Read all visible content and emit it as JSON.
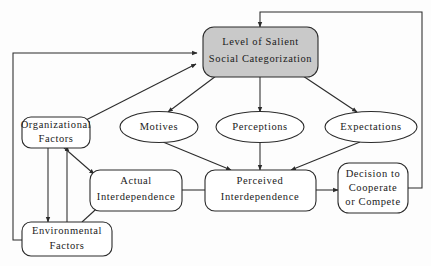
{
  "diagram": {
    "background_color": "#fdfdfd",
    "line_color": "#2b2b2b",
    "highlight_fill": "#c9c9c9",
    "node_fill": "#ffffff",
    "nodes": [
      {
        "id": "salient",
        "shape": "rounded-rect",
        "fill": "#c9c9c9",
        "lines": [
          "Level of Salient",
          "Social  Categorization"
        ]
      },
      {
        "id": "organizational",
        "shape": "rounded-rect",
        "fill": "#ffffff",
        "lines": [
          "Organizational",
          "Factors"
        ]
      },
      {
        "id": "environmental",
        "shape": "rounded-rect",
        "fill": "#ffffff",
        "lines": [
          "Environmental",
          "Factors"
        ]
      },
      {
        "id": "motives",
        "shape": "ellipse",
        "fill": "#ffffff",
        "lines": [
          "Motives"
        ]
      },
      {
        "id": "perceptions",
        "shape": "ellipse",
        "fill": "#ffffff",
        "lines": [
          "Perceptions"
        ]
      },
      {
        "id": "expectations",
        "shape": "ellipse",
        "fill": "#ffffff",
        "lines": [
          "Expectations"
        ]
      },
      {
        "id": "actual",
        "shape": "rounded-rect",
        "fill": "#ffffff",
        "lines": [
          "Actual",
          "Interdependence"
        ]
      },
      {
        "id": "perceived",
        "shape": "rounded-rect",
        "fill": "#ffffff",
        "lines": [
          "Perceived",
          "Interdependence"
        ]
      },
      {
        "id": "decision",
        "shape": "rounded-rect",
        "fill": "#ffffff",
        "lines": [
          "Decision  to",
          "Cooperate",
          "or  Compete"
        ]
      }
    ]
  }
}
